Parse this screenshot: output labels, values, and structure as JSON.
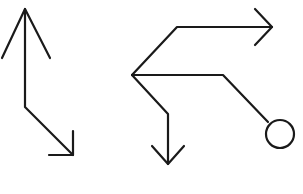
{
  "diagram": {
    "background": "#ffffff",
    "stroke_color": "#1a1a1a",
    "stroke_width": 2.2,
    "figures": [
      {
        "name": "left-bent-arrow",
        "description": "Vertical line with upward arrowhead, bending diagonally down-right to a second arrowhead",
        "path": [
          [
            25,
            9
          ],
          [
            25,
            107
          ],
          [
            73,
            155
          ]
        ],
        "arrowheads": [
          {
            "tip": [
              25,
              9
            ],
            "wings": [
              [
                2,
                58
              ],
              [
                50,
                58
              ]
            ],
            "direction": "up"
          },
          {
            "tip": [
              73,
              155
            ],
            "wings": [
              [
                73,
                131
              ],
              [
                49,
                155
              ]
            ],
            "direction": "down-right"
          }
        ]
      },
      {
        "name": "right-branching-figure",
        "description": "Three branches from a common vertex: one to a right arrow, one to a circle, one to a down arrow",
        "origin": [
          132,
          75
        ],
        "branches": [
          {
            "name": "upper-branch-right-arrow",
            "path": [
              [
                132,
                75
              ],
              [
                177,
                27
              ],
              [
                272,
                27
              ]
            ],
            "arrowhead": {
              "tip": [
                272,
                27
              ],
              "wings": [
                [
                  255,
                  9
                ],
                [
                  255,
                  45
                ]
              ],
              "direction": "right"
            }
          },
          {
            "name": "middle-branch-circle",
            "path": [
              [
                132,
                75
              ],
              [
                223,
                75
              ],
              [
                268,
                122
              ]
            ],
            "terminal_circle": {
              "cx": 280,
              "cy": 134,
              "r": 14
            }
          },
          {
            "name": "lower-branch-down-arrow",
            "path": [
              [
                132,
                75
              ],
              [
                168,
                114
              ],
              [
                168,
                164
              ]
            ],
            "arrowhead": {
              "tip": [
                168,
                164
              ],
              "wings": [
                [
                  152,
                  146
                ],
                [
                  184,
                  146
                ]
              ],
              "direction": "down"
            }
          }
        ]
      }
    ]
  }
}
